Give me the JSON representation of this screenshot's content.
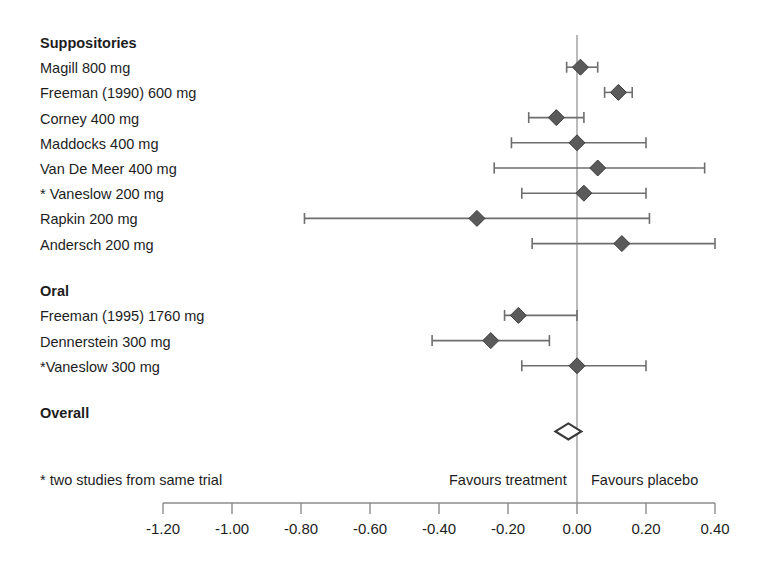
{
  "chart_data": {
    "type": "scatter",
    "subtype": "forest-plot",
    "title": "",
    "xlabel": "",
    "ylabel": "",
    "xlim": [
      -1.3,
      0.44
    ],
    "axis_ticks": [
      -1.2,
      -1.0,
      -0.8,
      -0.6,
      -0.4,
      -0.2,
      0.0,
      0.2,
      0.4
    ],
    "axis_tick_labels": [
      "-1.20",
      "-1.00",
      "-0.80",
      "-0.60",
      "-0.40",
      "-0.20",
      "0.00",
      "0.20",
      "0.40"
    ],
    "reference_line": 0.0,
    "grid": false,
    "legend": "none",
    "axis_left_label": "Favours treatment",
    "axis_right_label": "Favours placebo",
    "footnote": "* two studies from same trial",
    "marker_color": "#5a5a5a",
    "line_color": "#6e6e6e",
    "axis_color": "#8c8c8c",
    "groups": [
      {
        "name": "Suppositories",
        "rows": [
          {
            "label": "Magill 800 mg",
            "estimate": 0.01,
            "ci_low": -0.03,
            "ci_high": 0.06
          },
          {
            "label": "Freeman (1990) 600 mg",
            "estimate": 0.12,
            "ci_low": 0.08,
            "ci_high": 0.16
          },
          {
            "label": "Corney 400 mg",
            "estimate": -0.06,
            "ci_low": -0.14,
            "ci_high": 0.02
          },
          {
            "label": "Maddocks 400 mg",
            "estimate": 0.0,
            "ci_low": -0.19,
            "ci_high": 0.2
          },
          {
            "label": "Van De Meer 400 mg",
            "estimate": 0.06,
            "ci_low": -0.24,
            "ci_high": 0.37
          },
          {
            "label": "* Vaneslow 200 mg",
            "estimate": 0.02,
            "ci_low": -0.16,
            "ci_high": 0.2
          },
          {
            "label": "Rapkin 200 mg",
            "estimate": -0.29,
            "ci_low": -0.79,
            "ci_high": 0.21
          },
          {
            "label": "Andersch 200 mg",
            "estimate": 0.13,
            "ci_low": -0.13,
            "ci_high": 0.4
          }
        ]
      },
      {
        "name": "Oral",
        "rows": [
          {
            "label": "Freeman (1995) 1760 mg",
            "estimate": -0.17,
            "ci_low": -0.21,
            "ci_high": 0.0
          },
          {
            "label": "Dennerstein 300 mg",
            "estimate": -0.25,
            "ci_low": -0.42,
            "ci_high": -0.08
          },
          {
            "label": "*Vaneslow 300 mg",
            "estimate": 0.0,
            "ci_low": -0.16,
            "ci_high": 0.2
          }
        ]
      },
      {
        "name": "Overall",
        "rows": [
          {
            "label": "",
            "estimate": -0.025,
            "ci_low": -0.045,
            "ci_high": -0.005,
            "summary": true
          }
        ]
      }
    ]
  }
}
